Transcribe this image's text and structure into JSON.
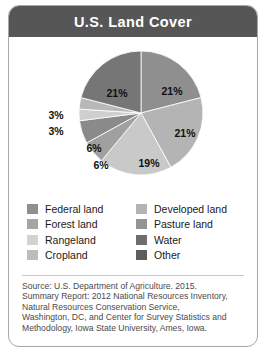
{
  "card": {
    "title": "U.S. Land Cover"
  },
  "chart_data": {
    "type": "pie",
    "title": "U.S. Land Cover",
    "categories": [
      "Federal land",
      "Developed land",
      "Pasture land",
      "Water",
      "Other",
      "Cropland",
      "Rangeland",
      "Forest land"
    ],
    "values": [
      21,
      21,
      19,
      6,
      6,
      3,
      3,
      21
    ],
    "labels": [
      "21%",
      "21%",
      "19%",
      "6%",
      "6%",
      "3%",
      "3%",
      "21%"
    ],
    "colors": [
      "#8f8f8f",
      "#b4b4b4",
      "#c9c9c9",
      "#a0a0a0",
      "#8a8a8a",
      "#cfcfcf",
      "#b8b8b8",
      "#767676"
    ],
    "legend_position": "below",
    "grid": false,
    "slices": [
      {
        "name": "Federal land",
        "value": 21,
        "label": "21%",
        "color": "#8f8f8f",
        "label_x": 163,
        "label_y": 58,
        "show_label": true
      },
      {
        "name": "Developed land",
        "value": 21,
        "label": "21%",
        "color": "#b4b4b4",
        "label_x": 176,
        "label_y": 100,
        "show_label": true
      },
      {
        "name": "Pasture land",
        "value": 19,
        "label": "19%",
        "color": "#c9c9c9",
        "label_x": 140,
        "label_y": 130,
        "show_label": true
      },
      {
        "name": "Water",
        "value": 6,
        "label": "6%",
        "color": "#a0a0a0",
        "label_x": 92,
        "label_y": 132,
        "show_label": true
      },
      {
        "name": "Other",
        "value": 6,
        "label": "6%",
        "color": "#8a8a8a",
        "label_x": 85,
        "label_y": 115,
        "show_label": true
      },
      {
        "name": "Cropland",
        "value": 3,
        "label": "3%",
        "color": "#cfcfcf",
        "label_x": 47,
        "label_y": 98,
        "show_label": true
      },
      {
        "name": "Rangeland",
        "value": 3,
        "label": "3%",
        "color": "#b8b8b8",
        "label_x": 47,
        "label_y": 82,
        "show_label": true
      },
      {
        "name": "Forest land",
        "value": 21,
        "label": "21%",
        "color": "#767676",
        "label_x": 108,
        "label_y": 60,
        "show_label": true
      }
    ]
  },
  "legend": {
    "items": [
      {
        "label": "Federal land",
        "color": "#8f8f8f"
      },
      {
        "label": "Developed land",
        "color": "#b4b4b4"
      },
      {
        "label": "Forest land",
        "color": "#a5a5a5"
      },
      {
        "label": "Pasture land",
        "color": "#949494"
      },
      {
        "label": "Rangeland",
        "color": "#d2d2d2"
      },
      {
        "label": "Water",
        "color": "#6e6e6e"
      },
      {
        "label": "Cropland",
        "color": "#bdbdbd"
      },
      {
        "label": "Other",
        "color": "#5e5e5e"
      }
    ]
  },
  "source": {
    "lines": [
      "Source: U.S. Department of Agriculture. 2015.",
      "Summary Report: 2012 National Resources Inventory,",
      "Natural Resources Conservation Service,",
      "Washington, DC, and Center for Survey Statistics and",
      "Methodology, Iowa State University, Ames, Iowa."
    ]
  }
}
